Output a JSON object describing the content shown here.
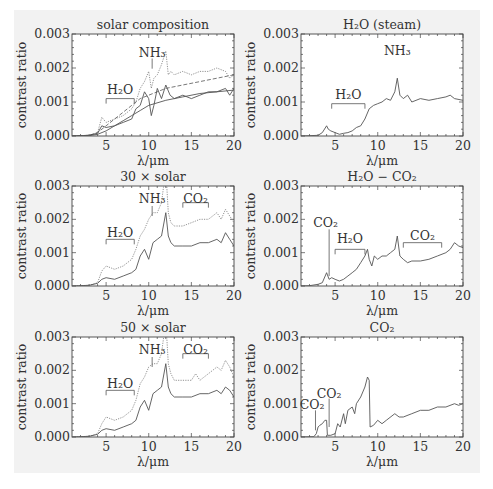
{
  "figure": {
    "background": "#f2f2f2",
    "line_color": "#555555"
  },
  "chart_data": [
    {
      "id": "solar",
      "type": "line",
      "title": "solar composition",
      "xlabel": "λ/μm",
      "ylabel": "contrast ratio",
      "xlim": [
        1,
        20
      ],
      "ylim": [
        0,
        0.003
      ],
      "xticks": [
        "5",
        "10",
        "15",
        "20"
      ],
      "yticks": [
        "0.000",
        "0.001",
        "0.002",
        "0.003"
      ],
      "annotations": [
        {
          "text": "NH₃",
          "kind": "line",
          "x": 10.4,
          "y_text": 0.00245,
          "y_line_top": 0.00228,
          "y_line_bottom": 0.00198
        },
        {
          "text": "H₂O",
          "kind": "bracket",
          "x1": 5,
          "x2": 8.3,
          "y": 0.0011,
          "y_text": 0.00135
        }
      ],
      "series": [
        {
          "name": "dotted-upper",
          "style": "dotted",
          "x": [
            1,
            3,
            4,
            4.5,
            5,
            6,
            7,
            8,
            8.5,
            9,
            9.5,
            10,
            10.3,
            10.6,
            11,
            11.5,
            12,
            12.3,
            12.6,
            13,
            14,
            15,
            16,
            17,
            18,
            19,
            19.5,
            20
          ],
          "y": [
            0,
            2e-05,
            0.0001,
            0.00055,
            0.0004,
            0.0005,
            0.0006,
            0.0008,
            0.001,
            0.0014,
            0.0016,
            0.0019,
            0.0014,
            0.0017,
            0.0018,
            0.0021,
            0.0025,
            0.0018,
            0.0019,
            0.0018,
            0.0019,
            0.0018,
            0.0019,
            0.0019,
            0.002,
            0.0019,
            0.0017,
            0.0018
          ]
        },
        {
          "name": "solid-noisy",
          "style": "solid",
          "x": [
            1,
            3,
            4,
            4.5,
            5,
            6,
            7,
            8,
            8.5,
            9,
            9.5,
            10,
            10.3,
            10.6,
            11,
            11.5,
            12,
            12.5,
            13,
            14,
            15,
            16,
            17,
            18,
            19,
            19.5,
            20
          ],
          "y": [
            0,
            2e-05,
            8e-05,
            0.0003,
            0.00025,
            0.0003,
            0.0004,
            0.0005,
            0.0008,
            0.0009,
            0.0013,
            0.0011,
            0.0006,
            0.0009,
            0.0014,
            0.0011,
            0.0015,
            0.0012,
            0.0011,
            0.0012,
            0.0011,
            0.0012,
            0.0013,
            0.0013,
            0.0014,
            0.0012,
            0.0014
          ]
        },
        {
          "name": "dashed-smooth",
          "style": "dashed",
          "x": [
            1,
            3,
            4,
            5,
            6,
            7,
            8,
            9,
            10,
            12,
            14,
            16,
            18,
            20
          ],
          "y": [
            0,
            2e-05,
            0.0001,
            0.0003,
            0.0005,
            0.0007,
            0.0009,
            0.0011,
            0.0012,
            0.0014,
            0.0015,
            0.0016,
            0.0017,
            0.0018
          ]
        },
        {
          "name": "solid-smooth",
          "style": "solid",
          "x": [
            1,
            3,
            4,
            5,
            6,
            7,
            8,
            9,
            10,
            12,
            14,
            16,
            18,
            20
          ],
          "y": [
            0,
            1e-05,
            5e-05,
            0.00015,
            0.0003,
            0.00045,
            0.0006,
            0.00075,
            0.0009,
            0.00105,
            0.00115,
            0.00125,
            0.0013,
            0.00135
          ]
        }
      ]
    },
    {
      "id": "steam",
      "type": "line",
      "title": "H₂O  (steam)",
      "xlabel": "λ/μm",
      "ylabel": "contrast ratio",
      "xlim": [
        1,
        20
      ],
      "ylim": [
        0,
        0.003
      ],
      "xticks": [
        "5",
        "10",
        "15",
        "20"
      ],
      "yticks": [
        "0.000",
        "0.001",
        "0.002",
        "0.003"
      ],
      "annotations": [
        {
          "text": "NH₃",
          "kind": "text",
          "x": 12.3,
          "y_text": 0.0025
        },
        {
          "text": "H₂O",
          "kind": "bracket",
          "x1": 4.6,
          "x2": 8.5,
          "y": 0.00095,
          "y_text": 0.0012
        }
      ],
      "series": [
        {
          "name": "steam",
          "style": "solid",
          "x": [
            1,
            2,
            3,
            3.5,
            4,
            4.2,
            4.5,
            5,
            5.5,
            6,
            6.5,
            7,
            7.5,
            8,
            8.5,
            9,
            9.5,
            10,
            10.5,
            11,
            11.5,
            12,
            12.3,
            12.6,
            13,
            13.5,
            14,
            15,
            16,
            17,
            18,
            18.5,
            19,
            20
          ],
          "y": [
            0,
            1e-05,
            2e-05,
            0.0001,
            0.0003,
            0.0002,
            0.00015,
            0.0001,
            5e-05,
            8e-05,
            0.0001,
            0.00015,
            0.00025,
            0.0003,
            0.0005,
            0.0008,
            0.0009,
            0.00095,
            0.001,
            0.0011,
            0.00105,
            0.0013,
            0.0017,
            0.0012,
            0.0011,
            0.0012,
            0.001,
            0.0011,
            0.00105,
            0.0011,
            0.00115,
            0.0012,
            0.0011,
            0.00105
          ]
        }
      ]
    },
    {
      "id": "30x",
      "type": "line",
      "title": "30 × solar",
      "xlabel": "λ/μm",
      "ylabel": "contrast ratio",
      "xlim": [
        1,
        20
      ],
      "ylim": [
        0,
        0.003
      ],
      "xticks": [
        "5",
        "10",
        "15",
        "20"
      ],
      "yticks": [
        "0.000",
        "0.001",
        "0.002",
        "0.003"
      ],
      "annotations": [
        {
          "text": "NH₃",
          "kind": "line",
          "x": 10.4,
          "y_text": 0.0026,
          "y_line_top": 0.0024,
          "y_line_bottom": 0.0021
        },
        {
          "text": "H₂O",
          "kind": "bracket",
          "x1": 5,
          "x2": 8.3,
          "y": 0.0014,
          "y_text": 0.0016
        },
        {
          "text": "CO₂",
          "kind": "bracket",
          "x1": 14,
          "x2": 17,
          "y": 0.0025,
          "y_text": 0.0026
        }
      ],
      "series": [
        {
          "name": "upper",
          "style": "dotted",
          "x": [
            1,
            3,
            4,
            4.5,
            5,
            6,
            7,
            8,
            8.5,
            9,
            9.5,
            10,
            10.5,
            11,
            11.5,
            12,
            12.3,
            12.6,
            13,
            14,
            15,
            16,
            17,
            18,
            18.5,
            19,
            19.5,
            20
          ],
          "y": [
            0,
            2e-05,
            0.0001,
            0.00045,
            0.0006,
            0.0005,
            0.0006,
            0.0008,
            0.0011,
            0.0015,
            0.0017,
            0.002,
            0.0022,
            0.0022,
            0.0025,
            0.0035,
            0.0022,
            0.0019,
            0.0018,
            0.0018,
            0.0019,
            0.002,
            0.002,
            0.0022,
            0.002,
            0.0023,
            0.0021,
            0.0019
          ]
        },
        {
          "name": "lower",
          "style": "solid",
          "x": [
            1,
            3,
            4,
            4.5,
            5,
            6,
            7,
            8,
            8.5,
            9,
            9.5,
            10,
            10.5,
            11,
            11.5,
            12,
            12.3,
            12.6,
            13,
            14,
            15,
            16,
            17,
            18,
            18.5,
            19,
            19.5,
            20
          ],
          "y": [
            0,
            2e-05,
            8e-05,
            0.0002,
            0.00025,
            0.0002,
            0.0003,
            0.0004,
            0.0005,
            0.0009,
            0.0011,
            0.0008,
            0.0013,
            0.0014,
            0.0015,
            0.0022,
            0.0015,
            0.0013,
            0.0012,
            0.0012,
            0.0012,
            0.0013,
            0.0013,
            0.0014,
            0.0013,
            0.0016,
            0.0014,
            0.0012
          ]
        }
      ]
    },
    {
      "id": "h2o-co2",
      "type": "line",
      "title": "H₂O − CO₂",
      "xlabel": "λ/μm",
      "ylabel": "contrast ratio",
      "xlim": [
        1,
        20
      ],
      "ylim": [
        0,
        0.003
      ],
      "xticks": [
        "5",
        "10",
        "15",
        "20"
      ],
      "yticks": [
        "0.000",
        "0.001",
        "0.002",
        "0.003"
      ],
      "annotations": [
        {
          "text": "CO₂",
          "kind": "line",
          "x": 4.3,
          "y_text": 0.0019,
          "y_line_top": 0.0017,
          "y_line_bottom": 0.0003,
          "text_x": 3.9
        },
        {
          "text": "H₂O",
          "kind": "bracket",
          "x1": 5,
          "x2": 8.5,
          "y": 0.0011,
          "y_text": 0.0014
        },
        {
          "text": "CO₂",
          "kind": "bracket",
          "x1": 13,
          "x2": 17.5,
          "y": 0.0013,
          "y_text": 0.0015
        }
      ],
      "series": [
        {
          "name": "h2o-co2",
          "style": "solid",
          "x": [
            1,
            2,
            3,
            3.5,
            4,
            4.3,
            4.6,
            5,
            5.5,
            6,
            6.5,
            7,
            7.5,
            8,
            8.5,
            8.8,
            9,
            9.3,
            9.6,
            10,
            10.5,
            11,
            11.5,
            12,
            12.3,
            12.6,
            13,
            13.5,
            14,
            15,
            16,
            17,
            18,
            18.5,
            19,
            19.5,
            20
          ],
          "y": [
            0,
            1e-05,
            5e-05,
            0.0001,
            0.0004,
            0.0002,
            0.00025,
            0.0002,
            0.00015,
            0.0002,
            0.0003,
            0.0004,
            0.0005,
            0.0007,
            0.0009,
            0.0011,
            0.0008,
            0.0006,
            0.0009,
            0.0008,
            0.0009,
            0.0009,
            0.001,
            0.0011,
            0.0015,
            0.0009,
            0.0008,
            0.0007,
            0.00075,
            0.00075,
            0.0008,
            0.0009,
            0.001,
            0.0011,
            0.0013,
            0.0012,
            0.00115
          ]
        }
      ]
    },
    {
      "id": "50x",
      "type": "line",
      "title": "50 × solar",
      "xlabel": "λ/μm",
      "ylabel": "contrast ratio",
      "xlim": [
        1,
        20
      ],
      "ylim": [
        0,
        0.003
      ],
      "xticks": [
        "5",
        "10",
        "15",
        "20"
      ],
      "yticks": [
        "0.000",
        "0.001",
        "0.002",
        "0.003"
      ],
      "annotations": [
        {
          "text": "NH₃",
          "kind": "line",
          "x": 10.4,
          "y_text": 0.0026,
          "y_line_top": 0.0024,
          "y_line_bottom": 0.0021
        },
        {
          "text": "H₂O",
          "kind": "bracket",
          "x1": 5,
          "x2": 8.3,
          "y": 0.0014,
          "y_text": 0.0016
        },
        {
          "text": "CO₂",
          "kind": "bracket",
          "x1": 14,
          "x2": 17,
          "y": 0.0025,
          "y_text": 0.0026
        }
      ],
      "series": [
        {
          "name": "upper",
          "style": "dotted",
          "x": [
            1,
            3,
            4,
            4.5,
            5,
            6,
            7,
            8,
            8.5,
            9,
            9.5,
            10,
            10.5,
            11,
            11.5,
            12,
            12.3,
            12.6,
            13,
            14,
            15,
            15.5,
            16,
            17,
            18,
            18.5,
            19,
            19.5,
            20
          ],
          "y": [
            0,
            2e-05,
            0.0001,
            0.0004,
            0.0006,
            0.0005,
            0.0006,
            0.0008,
            0.0011,
            0.0016,
            0.0018,
            0.0021,
            0.0022,
            0.0022,
            0.0025,
            0.0035,
            0.0022,
            0.0019,
            0.0017,
            0.0017,
            0.0017,
            0.0019,
            0.0017,
            0.0019,
            0.0021,
            0.002,
            0.0023,
            0.0021,
            0.0018
          ]
        },
        {
          "name": "lower",
          "style": "solid",
          "x": [
            1,
            3,
            4,
            4.5,
            5,
            6,
            7,
            8,
            8.5,
            9,
            9.5,
            10,
            10.5,
            11,
            11.5,
            12,
            12.3,
            12.6,
            13,
            14,
            15,
            16,
            17,
            18,
            18.5,
            19,
            19.5,
            20
          ],
          "y": [
            0,
            2e-05,
            8e-05,
            0.0002,
            0.00025,
            0.0002,
            0.0003,
            0.0004,
            0.0005,
            0.0009,
            0.0011,
            0.0008,
            0.0013,
            0.0014,
            0.0015,
            0.0022,
            0.0015,
            0.0013,
            0.0012,
            0.0012,
            0.0012,
            0.0013,
            0.0013,
            0.0014,
            0.0013,
            0.0015,
            0.0014,
            0.0012
          ]
        }
      ]
    },
    {
      "id": "co2",
      "type": "line",
      "title": "CO₂",
      "xlabel": "λ/μm",
      "ylabel": "contrast ratio",
      "xlim": [
        1,
        20
      ],
      "ylim": [
        0,
        0.003
      ],
      "xticks": [
        "5",
        "10",
        "15",
        "20"
      ],
      "yticks": [
        "0.000",
        "0.001",
        "0.002",
        "0.003"
      ],
      "annotations": [
        {
          "text": "CO₂",
          "kind": "line",
          "x": 2.7,
          "y_text": 0.00095,
          "y_line_top": 0.0008,
          "y_line_bottom": 0.0002,
          "text_x": 2.3
        },
        {
          "text": "CO₂",
          "kind": "line",
          "x": 4.3,
          "y_text": 0.0013,
          "y_line_top": 0.00115,
          "y_line_bottom": 0.0003,
          "text_x": 4.3
        }
      ],
      "series": [
        {
          "name": "co2",
          "style": "solid",
          "x": [
            1,
            2.5,
            2.8,
            3,
            3.2,
            3.5,
            3.8,
            4,
            4.1,
            4.5,
            5,
            5.3,
            5.6,
            6,
            6.2,
            6.5,
            7,
            7.3,
            7.5,
            8,
            8.5,
            8.8,
            9,
            9.1,
            9.5,
            10,
            10.5,
            11,
            12,
            12.5,
            13,
            14,
            15,
            16,
            17,
            18,
            19,
            19.5,
            20
          ],
          "y": [
            0,
            1e-05,
            0.0001,
            0.0003,
            0.00035,
            0.0004,
            0.0005,
            0.0005,
            5e-05,
            5e-05,
            0.0001,
            0.0004,
            0.0003,
            0.0007,
            0.0004,
            0.0008,
            0.0009,
            0.0007,
            0.001,
            0.0012,
            0.0015,
            0.0018,
            0.0017,
            0.0003,
            0.00035,
            0.0005,
            0.0004,
            0.0005,
            0.0007,
            0.0006,
            0.0006,
            0.0007,
            0.0008,
            0.0008,
            0.0009,
            0.0009,
            0.001,
            0.00095,
            0.001
          ]
        }
      ]
    }
  ]
}
